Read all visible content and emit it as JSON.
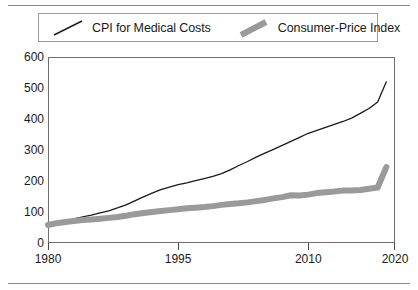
{
  "chart_data": {
    "type": "line",
    "title": "",
    "xlabel": "",
    "ylabel": "",
    "xlim": [
      1980,
      2020
    ],
    "ylim": [
      0,
      600
    ],
    "grid": true,
    "legend_position": "top",
    "yticks": [
      0,
      100,
      200,
      300,
      400,
      500,
      600
    ],
    "ytick_labels": [
      "0",
      "100",
      "200",
      "300",
      "400",
      "500",
      "600"
    ],
    "xticks": [
      1980,
      1995,
      2010,
      2020
    ],
    "xtick_labels": [
      "1980",
      "1995",
      "2010",
      "2020"
    ],
    "series": [
      {
        "name": "CPI for Medical Costs",
        "style": "thin-line",
        "color": "#1a1a1a",
        "linewidth": 1.3,
        "x": [
          1980,
          1981,
          1982,
          1983,
          1984,
          1985,
          1986,
          1987,
          1988,
          1989,
          1990,
          1991,
          1992,
          1993,
          1994,
          1995,
          1996,
          1997,
          1998,
          1999,
          2000,
          2001,
          2002,
          2003,
          2004,
          2005,
          2006,
          2007,
          2008,
          2009,
          2010,
          2011,
          2012,
          2013,
          2014,
          2015,
          2016,
          2017,
          2018,
          2019
        ],
        "values": [
          55,
          62,
          70,
          78,
          84,
          90,
          97,
          104,
          113,
          123,
          136,
          149,
          161,
          172,
          180,
          188,
          194,
          201,
          208,
          215,
          224,
          236,
          250,
          263,
          277,
          290,
          302,
          315,
          328,
          341,
          354,
          363,
          373,
          383,
          392,
          403,
          418,
          434,
          455,
          520
        ]
      },
      {
        "name": "Consumer-Price Index",
        "style": "thick-line",
        "color": "#9a9a9a",
        "linewidth": 6,
        "x": [
          1980,
          1981,
          1982,
          1983,
          1984,
          1985,
          1986,
          1987,
          1988,
          1989,
          1990,
          1991,
          1992,
          1993,
          1994,
          1995,
          1996,
          1997,
          1998,
          1999,
          2000,
          2001,
          2002,
          2003,
          2004,
          2005,
          2006,
          2007,
          2008,
          2009,
          2010,
          2011,
          2012,
          2013,
          2014,
          2015,
          2016,
          2017,
          2018,
          2019
        ],
        "values": [
          58,
          64,
          68,
          71,
          74,
          76,
          78,
          81,
          84,
          88,
          93,
          97,
          100,
          103,
          106,
          109,
          112,
          114,
          116,
          119,
          123,
          126,
          128,
          131,
          135,
          139,
          144,
          148,
          154,
          153,
          156,
          161,
          164,
          166,
          169,
          169,
          171,
          175,
          179,
          245
        ]
      }
    ]
  },
  "legend": {
    "entries": [
      {
        "label": "CPI for Medical Costs",
        "swatch": "thin-diagonal-line"
      },
      {
        "label": "Consumer-Price Index",
        "swatch": "thick-diagonal-line"
      }
    ]
  }
}
